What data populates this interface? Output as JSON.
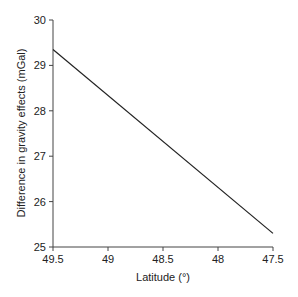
{
  "chart_data": {
    "type": "line",
    "title": "",
    "xlabel": "Latitude (°)",
    "ylabel": "Difference in gravity effects (mGal)",
    "xlim": [
      49.5,
      47.5
    ],
    "ylim": [
      25,
      30
    ],
    "x_reversed": true,
    "grid": false,
    "legend": null,
    "x_ticks": [
      "49.5",
      "49",
      "48.5",
      "48",
      "47.5"
    ],
    "y_ticks": [
      "25",
      "26",
      "27",
      "28",
      "29",
      "30"
    ],
    "series": [
      {
        "name": "gravity difference",
        "color": "#222222",
        "x": [
          49.5,
          47.5
        ],
        "y": [
          29.35,
          25.3
        ]
      }
    ]
  }
}
